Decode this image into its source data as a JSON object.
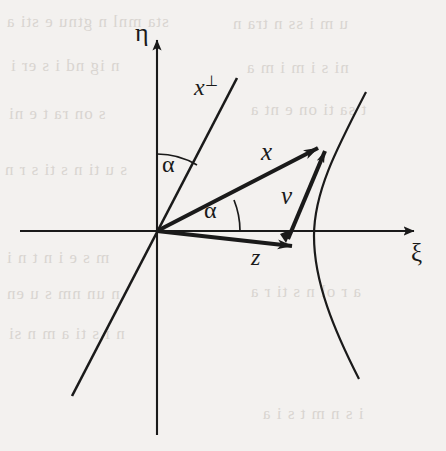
{
  "figure": {
    "kind": "vector-geometry-diagram",
    "width": 446,
    "height": 451,
    "background_color": "#f3f1ef",
    "ink_color": "#1a1a1a"
  },
  "axes": {
    "horizontal": {
      "label": "ξ",
      "name": "xi-axis",
      "from": [
        20,
        231
      ],
      "to": [
        420,
        231
      ],
      "arrow": "right"
    },
    "vertical": {
      "label": "η",
      "name": "eta-axis",
      "from": [
        157,
        435
      ],
      "to": [
        157,
        32
      ],
      "arrow": "up"
    },
    "origin": [
      157,
      231
    ]
  },
  "lines": [
    {
      "name": "x-perp-line",
      "label": "x",
      "superscript": "⊥",
      "from": [
        72,
        396
      ],
      "to": [
        237,
        78
      ]
    }
  ],
  "vectors": [
    {
      "name": "vector-x",
      "label": "x",
      "from": [
        157,
        231
      ],
      "to": [
        331,
        141
      ]
    },
    {
      "name": "vector-z",
      "label": "z",
      "from": [
        157,
        231
      ],
      "to": [
        306,
        247
      ]
    },
    {
      "name": "vector-v",
      "label": "v",
      "from": [
        288,
        239
      ],
      "to": [
        328,
        144
      ]
    }
  ],
  "angles": [
    {
      "name": "angle-alpha-upper",
      "label": "α",
      "between": [
        "eta-axis",
        "x-perp-line"
      ],
      "label_pos": [
        164,
        154
      ]
    },
    {
      "name": "angle-alpha-lower",
      "label": "α",
      "between": [
        "vector-x",
        "xi-axis"
      ],
      "label_pos": [
        205,
        200
      ]
    }
  ],
  "curve": {
    "name": "hyperbola-branch",
    "description": "curve opening leftward, vertex near the xi-axis, passing through the head of vector x",
    "vertex": [
      314,
      236
    ],
    "upper_end": [
      366,
      92
    ],
    "lower_end": [
      359,
      379
    ]
  },
  "labels": {
    "xi": "ξ",
    "eta": "η",
    "x_perp_base": "x",
    "x_perp_sup": "⊥",
    "x": "x",
    "v": "v",
    "z": "z",
    "alpha_upper": "α",
    "alpha_lower": "α"
  },
  "ghost_text": {
    "lines": [
      "sta  mnl  n  gtnu  e  sti a",
      "u   m  i  ss    n tra  n",
      "n ig    nd   i  s    er i",
      "ni    s i  m      i    m a",
      "s  on    ra     t e  ni",
      "t sa   ti  on    e      nt a",
      "s u   ti    n  s  ti  s r n",
      "m  s  e  i    n   t   n  i",
      "n  un     nm    s   u  en",
      "a   r   ol   n  s  ti r  a",
      "n  i    s ti  a  m   n  si",
      "i  s  n  m    t    s  i  a"
    ]
  }
}
